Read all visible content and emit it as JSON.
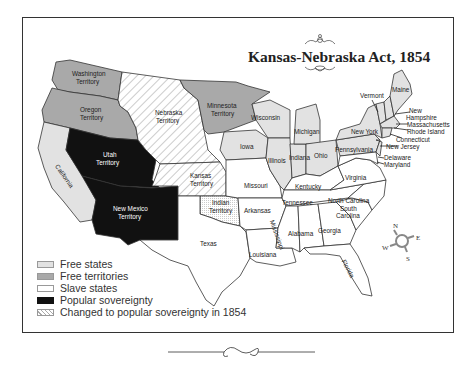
{
  "title": "Kansas-Nebraska Act, 1854",
  "colors": {
    "free_states": "#e2e2e2",
    "free_territories": "#a9a9a9",
    "slave_states": "#ffffff",
    "popular_sovereignty": "#111111",
    "border": "#333333"
  },
  "legend": [
    {
      "key": "free_states",
      "label": "Free states"
    },
    {
      "key": "free_territories",
      "label": "Free territories"
    },
    {
      "key": "slave_states",
      "label": "Slave states"
    },
    {
      "key": "popular_sovereignty",
      "label": "Popular sovereignty"
    },
    {
      "key": "changed",
      "label": "Changed to popular sovereignty in 1854"
    }
  ],
  "regions": {
    "washington": [
      "Washington",
      "Territory"
    ],
    "oregon": [
      "Oregon",
      "Territory"
    ],
    "nebraska": [
      "Nebraska",
      "Territory"
    ],
    "minnesota": [
      "Minnesota",
      "Territory"
    ],
    "utah": [
      "Utah",
      "Territory"
    ],
    "new_mexico": [
      "New Mexico",
      "Territory"
    ],
    "kansas": [
      "Kansas",
      "Territory"
    ],
    "indian": [
      "Indian",
      "Territory"
    ],
    "california": "California",
    "texas": "Texas",
    "iowa": "Iowa",
    "wisconsin": "Wisconsin",
    "michigan": "Michigan",
    "illinois": "Illinois",
    "indiana": "Indiana",
    "ohio": "Ohio",
    "missouri": "Missouri",
    "arkansas": "Arkansas",
    "louisiana": "Louisiana",
    "mississippi": "Mississippi",
    "alabama": "Alabama",
    "georgia": "Georgia",
    "florida": "Florida",
    "tennessee": "Tennessee",
    "kentucky": "Kentucky",
    "virginia": "Virginia",
    "north_carolina": "North Carolina",
    "south_carolina": [
      "South",
      "Carolina"
    ],
    "pennsylvania": "Pennsylvania",
    "new_york": "New York",
    "vermont": "Vermont",
    "maine": "Maine",
    "new_hampshire": [
      "New",
      "Hampshire"
    ],
    "massachusetts": "Massachusetts",
    "rhode_island": "Rhode Island",
    "connecticut": "Connecticut",
    "new_jersey": "New Jersey",
    "delaware": "Delaware",
    "maryland": "Maryland"
  },
  "compass": {
    "n": "N",
    "e": "E",
    "s": "S",
    "w": "W"
  }
}
